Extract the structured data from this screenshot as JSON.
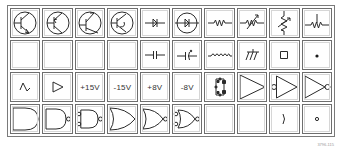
{
  "grid": {
    "columns": 10,
    "rows": 4
  },
  "cells": [
    {
      "row": 1,
      "col": 1,
      "symbol": "npn-transistor",
      "text": ""
    },
    {
      "row": 1,
      "col": 2,
      "symbol": "pnp-transistor",
      "text": ""
    },
    {
      "row": 1,
      "col": 3,
      "symbol": "npn-transistor-variant",
      "text": ""
    },
    {
      "row": 1,
      "col": 4,
      "symbol": "pnp-transistor-variant",
      "text": ""
    },
    {
      "row": 1,
      "col": 5,
      "symbol": "diode",
      "text": ""
    },
    {
      "row": 1,
      "col": 6,
      "symbol": "diode-in-circle",
      "text": ""
    },
    {
      "row": 1,
      "col": 7,
      "symbol": "resistor",
      "text": ""
    },
    {
      "row": 1,
      "col": 8,
      "symbol": "variable-resistor",
      "text": ""
    },
    {
      "row": 1,
      "col": 9,
      "symbol": "potentiometer-vertical",
      "text": ""
    },
    {
      "row": 1,
      "col": 10,
      "symbol": "resistor-tap",
      "text": ""
    },
    {
      "row": 2,
      "col": 1,
      "symbol": "empty",
      "text": ""
    },
    {
      "row": 2,
      "col": 2,
      "symbol": "empty",
      "text": ""
    },
    {
      "row": 2,
      "col": 3,
      "symbol": "empty",
      "text": ""
    },
    {
      "row": 2,
      "col": 4,
      "symbol": "empty",
      "text": ""
    },
    {
      "row": 2,
      "col": 5,
      "symbol": "capacitor",
      "text": ""
    },
    {
      "row": 2,
      "col": 6,
      "symbol": "polarized-capacitor",
      "text": ""
    },
    {
      "row": 2,
      "col": 7,
      "symbol": "inductor",
      "text": ""
    },
    {
      "row": 2,
      "col": 8,
      "symbol": "chassis-ground",
      "text": ""
    },
    {
      "row": 2,
      "col": 9,
      "symbol": "square-pad",
      "text": ""
    },
    {
      "row": 2,
      "col": 10,
      "symbol": "junction-dot",
      "text": ""
    },
    {
      "row": 3,
      "col": 1,
      "symbol": "ac-source-wave",
      "text": ""
    },
    {
      "row": 3,
      "col": 2,
      "symbol": "small-buffer",
      "text": ""
    },
    {
      "row": 3,
      "col": 3,
      "symbol": "label",
      "text": "+15V"
    },
    {
      "row": 3,
      "col": 4,
      "symbol": "label",
      "text": "-15V"
    },
    {
      "row": 3,
      "col": 5,
      "symbol": "label",
      "text": "+8V"
    },
    {
      "row": 3,
      "col": 6,
      "symbol": "label",
      "text": "-8V"
    },
    {
      "row": 3,
      "col": 7,
      "symbol": "bridge-rectifier",
      "text": ""
    },
    {
      "row": 3,
      "col": 8,
      "symbol": "buffer-amplifier",
      "text": ""
    },
    {
      "row": 3,
      "col": 9,
      "symbol": "inverting-input-buffer",
      "text": ""
    },
    {
      "row": 3,
      "col": 10,
      "symbol": "inverter",
      "text": ""
    },
    {
      "row": 4,
      "col": 1,
      "symbol": "and-gate",
      "text": ""
    },
    {
      "row": 4,
      "col": 2,
      "symbol": "nand-gate",
      "text": ""
    },
    {
      "row": 4,
      "col": 3,
      "symbol": "nand-gate-inverted-inputs",
      "text": ""
    },
    {
      "row": 4,
      "col": 4,
      "symbol": "or-gate",
      "text": ""
    },
    {
      "row": 4,
      "col": 5,
      "symbol": "nor-gate",
      "text": ""
    },
    {
      "row": 4,
      "col": 6,
      "symbol": "nor-gate-inverted-inputs",
      "text": ""
    },
    {
      "row": 4,
      "col": 7,
      "symbol": "empty",
      "text": ""
    },
    {
      "row": 4,
      "col": 8,
      "symbol": "empty",
      "text": ""
    },
    {
      "row": 4,
      "col": 9,
      "symbol": "arc",
      "text": ")"
    },
    {
      "row": 4,
      "col": 10,
      "symbol": "small-circle",
      "text": ""
    }
  ],
  "caption": "3796-115",
  "colors": {
    "stroke": "#2a2a2a",
    "border": "#6e6e6e",
    "background": "#ffffff"
  }
}
